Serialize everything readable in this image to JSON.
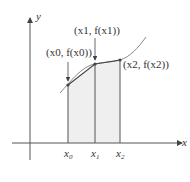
{
  "diagram": {
    "axes": {
      "x_label": "x",
      "y_label": "y"
    },
    "ticks": [
      {
        "id": "x0",
        "base": "x",
        "sub": "0"
      },
      {
        "id": "x1",
        "base": "x",
        "sub": "1"
      },
      {
        "id": "x2",
        "base": "x",
        "sub": "2"
      }
    ],
    "points": [
      {
        "id": "p0",
        "label": "(x0, f(x0))"
      },
      {
        "id": "p1",
        "label": "(x1, f(x1))"
      },
      {
        "id": "p2",
        "label": "(x2, f(x2))"
      }
    ],
    "colors": {
      "axis": "#555555",
      "curve": "#777777",
      "shade": "#efefef",
      "chord": "#444444"
    }
  }
}
